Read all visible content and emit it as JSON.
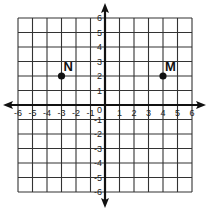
{
  "chart_data": {
    "type": "scatter",
    "title": "",
    "xlabel": "",
    "ylabel": "",
    "xlim": [
      -6,
      6
    ],
    "ylim": [
      -6,
      6
    ],
    "grid": true,
    "x_ticks": [
      -6,
      -5,
      -4,
      -3,
      -2,
      -1,
      1,
      2,
      3,
      4,
      5,
      6
    ],
    "y_ticks": [
      6,
      5,
      4,
      3,
      2,
      1,
      -1,
      -2,
      -3,
      -4,
      -5,
      -6
    ],
    "origin_label": "0",
    "points": [
      {
        "label": "N",
        "x": -3,
        "y": 2
      },
      {
        "label": "M",
        "x": 4,
        "y": 2
      }
    ]
  },
  "colors": {
    "grid": "#333333",
    "axis": "#111111",
    "point": "#111111"
  }
}
